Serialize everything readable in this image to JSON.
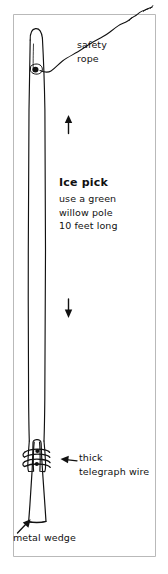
{
  "figure": {
    "type": "hand-drawn line illustration",
    "background_color": "#ffffff",
    "ink_color": "#111111",
    "frame_color": "#b9b9b9"
  },
  "labels": {
    "safety_rope": {
      "line1": "safety",
      "line2": "rope"
    },
    "heading": "Ice pick",
    "spec": {
      "line1": "use a green",
      "line2": "willow pole",
      "line3": "10 feet long"
    },
    "telegraph_wire": {
      "line1": "thick",
      "line2": "telegraph wire"
    },
    "metal_wedge": "metal wedge"
  },
  "icons": {
    "arrow_up": "arrow-up-icon",
    "arrow_down": "arrow-down-icon",
    "arrow_left_pointer": "arrow-left-icon",
    "arrow_up_right_pointer": "arrow-up-right-icon"
  },
  "parts": {
    "pole": "willow-pole",
    "rope": "safety-rope",
    "knot": "rope-knot",
    "wire_wraps": "telegraph-wire-wraps",
    "wedge": "metal-wedge-shape"
  }
}
